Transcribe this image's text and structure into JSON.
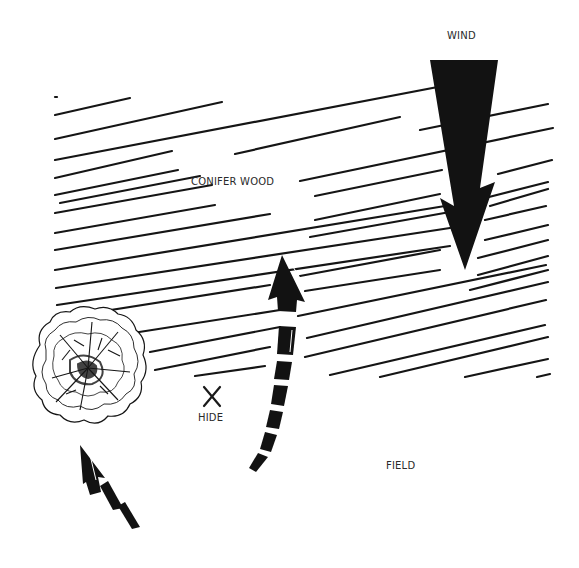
{
  "labels": {
    "wind": "WIND",
    "conifer_wood": "CONIFER WOOD",
    "hide": "HIDE",
    "field": "FIELD",
    "hide_marker": "X"
  },
  "colors": {
    "ink": "#151515",
    "text": "#2a2a2a",
    "background": "#ffffff"
  },
  "elements": {
    "wind_arrow": {
      "direction": "down",
      "x": 463,
      "y_top": 60,
      "y_tip": 268
    },
    "tree": {
      "cx": 88,
      "cy": 370,
      "r": 57
    },
    "hide": {
      "x": 212,
      "y": 395
    },
    "approach_arrow_long": {
      "from": [
        252,
        470
      ],
      "to": [
        282,
        255
      ]
    },
    "approach_arrow_short": {
      "from": [
        138,
        528
      ],
      "to": [
        82,
        445
      ]
    }
  },
  "hatch_lines": [
    [
      55,
      97,
      57,
      97
    ],
    [
      55,
      115,
      130,
      98
    ],
    [
      55,
      139,
      222,
      102
    ],
    [
      235,
      154,
      400,
      117
    ],
    [
      420,
      130,
      548,
      104
    ],
    [
      55,
      160,
      490,
      77
    ],
    [
      55,
      178,
      172,
      151
    ],
    [
      300,
      181,
      553,
      128
    ],
    [
      55,
      195,
      178,
      170
    ],
    [
      60,
      203,
      200,
      176
    ],
    [
      55,
      213,
      212,
      185
    ],
    [
      315,
      196,
      442,
      170
    ],
    [
      498,
      174,
      552,
      160
    ],
    [
      55,
      233,
      215,
      205
    ],
    [
      315,
      220,
      440,
      194
    ],
    [
      485,
      198,
      548,
      182
    ],
    [
      55,
      250,
      270,
      214
    ],
    [
      310,
      237,
      450,
      212
    ],
    [
      490,
      206,
      548,
      189
    ],
    [
      55,
      270,
      445,
      206
    ],
    [
      485,
      220,
      546,
      206
    ],
    [
      56,
      288,
      450,
      228
    ],
    [
      485,
      240,
      548,
      225
    ],
    [
      57,
      305,
      450,
      246
    ],
    [
      478,
      258,
      548,
      240
    ],
    [
      60,
      318,
      270,
      285
    ],
    [
      300,
      276,
      440,
      250
    ],
    [
      478,
      275,
      548,
      256
    ],
    [
      120,
      335,
      280,
      310
    ],
    [
      305,
      291,
      440,
      270
    ],
    [
      470,
      290,
      548,
      270
    ],
    [
      150,
      352,
      280,
      327
    ],
    [
      298,
      316,
      546,
      265
    ],
    [
      155,
      370,
      270,
      347
    ],
    [
      307,
      338,
      548,
      282
    ],
    [
      195,
      376,
      265,
      366
    ],
    [
      305,
      357,
      546,
      300
    ],
    [
      330,
      375,
      545,
      325
    ],
    [
      380,
      377,
      548,
      337
    ],
    [
      465,
      377,
      548,
      359
    ],
    [
      537,
      377,
      550,
      374
    ]
  ]
}
